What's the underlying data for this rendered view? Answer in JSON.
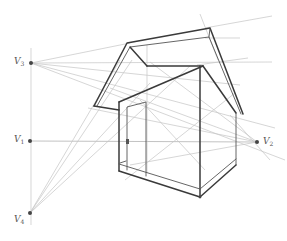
{
  "diagram": {
    "colors": {
      "construction_line": "#c4c4c4",
      "object_edge": "#3a3a3a",
      "vanishing_point": "#444444",
      "label": "#555555"
    },
    "vanishing_points": [
      {
        "id": "V1",
        "letter": "V",
        "index": "1",
        "x": 30,
        "y": 141,
        "role": "left vanishing point on horizon"
      },
      {
        "id": "V2",
        "letter": "V",
        "index": "2",
        "x": 257,
        "y": 142,
        "role": "right vanishing point on horizon"
      },
      {
        "id": "V3",
        "letter": "V",
        "index": "3",
        "x": 31,
        "y": 63,
        "role": "upper vanishing point for rising roof slope"
      },
      {
        "id": "V4",
        "letter": "V",
        "index": "4",
        "x": 30,
        "y": 213,
        "role": "lower vanishing point for falling roof slope"
      }
    ],
    "horizon": {
      "label": "",
      "y": 141
    },
    "object": "house with gable roof and door"
  }
}
